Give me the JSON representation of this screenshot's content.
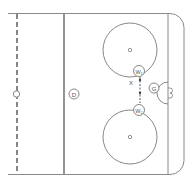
{
  "diagram": {
    "type": "hockey-rink-half",
    "colors": {
      "line": "#7a7a7a",
      "thick_line": "#8a8a8a",
      "background": "#ffffff"
    },
    "players": [
      {
        "id": "D",
        "label": "D",
        "role": "defenseman"
      },
      {
        "id": "W1",
        "label": "W₁",
        "role": "wing"
      },
      {
        "id": "W2",
        "label": "W₂",
        "role": "wing"
      },
      {
        "id": "G",
        "label": "G",
        "role": "goalie"
      }
    ],
    "marker": {
      "label": "X"
    }
  }
}
